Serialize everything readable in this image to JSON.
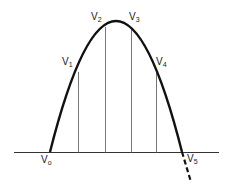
{
  "diagram": {
    "colors": {
      "curve": "#111111",
      "ordinate": "#777777",
      "baseline": "#333333",
      "background": "#ffffff"
    },
    "labels": [
      {
        "id": "v0",
        "base": "V",
        "sub": "o",
        "x": 41,
        "y": 155
      },
      {
        "id": "v1",
        "base": "V",
        "sub": "1",
        "x": 62,
        "y": 57
      },
      {
        "id": "v2",
        "base": "V",
        "sub": "2",
        "x": 91,
        "y": 12
      },
      {
        "id": "v3",
        "base": "V",
        "sub": "3",
        "x": 129,
        "y": 12
      },
      {
        "id": "v4",
        "base": "V",
        "sub": "4",
        "x": 156,
        "y": 57
      },
      {
        "id": "v5",
        "base": "V",
        "sub": "5",
        "x": 187,
        "y": 154
      }
    ]
  }
}
